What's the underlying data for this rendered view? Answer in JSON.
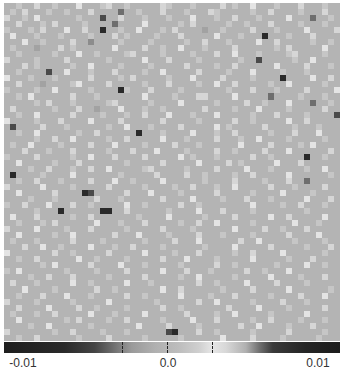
{
  "chart_data": {
    "type": "heatmap",
    "title": "",
    "xlabel": "",
    "ylabel": "",
    "grid_size": [
      56,
      56
    ],
    "colormap": "diverging gray (dark at both extremes, light near +0.003)",
    "value_range": [
      -0.012,
      0.012
    ],
    "base_color": "#b4b4b4",
    "colorbar": {
      "orientation": "horizontal",
      "position": "bottom",
      "tick_labels": [
        "-0.01",
        "0.0",
        "0.01"
      ],
      "tick_label_positions_px": [
        23,
        168,
        318
      ],
      "dashed_ticks_px": [
        122,
        167,
        212
      ]
    },
    "levels_legend": {
      "0": "#b4b4b4",
      "1": "#c6c6c6",
      "2": "#d6d6d6",
      "3": "#e4e4e4",
      "4": "#a2a2a2",
      "5": "#8c8c8c",
      "6": "#6e6e6e",
      "7": "#4a4a4a",
      "8": "#2a2a2a"
    },
    "rows": [
      "00100200100030001200100000210001000020100300010002000100",
      "01020001001000200006001000200010002100000100200001000200",
      "20010300000010007002000100010003000100200010000300060010",
      "00200010200001000060000300000102000001001000200001000100",
      "10001020003002008001003000102000040010000200010000300002",
      "03000100010000100020100001000200000300010008000100020000",
      "00030010000200500001000010000010020001000030020000010010",
      "01000400020100000030000200100300010000200000010200000300",
      "00100000100030010000120000100001000200300010000120000100",
      "20000100002000000100000300020000100000010070000010030000",
      "00020100000100300001000010000020000100200000030000200010",
      "00100007003000100020000100300000200001000300001000100000",
      "30001000100000200001020000010003000020000100008000030020",
      "00200040000130000200000100020000100300200000100300000100",
      "10000100300000100008100020000100000001000200010000200003",
      "00103000000200010000000300001000220000300000600001000100",
      "00000102000100000120000010000300000100002001000300060010",
      "02000000100020040003000100100000020000100030000100000200",
      "00100300000200001000100200030001000300000100020000100007",
      "30000100020000300002000000200000100000200100000300200000",
      "07000020001000000100300010000200000301000002000010001000",
      "00100300000010020000008000100003000100200000100020003000",
      "00000100200300000100200000300010000200010030000100000100",
      "01003000010000200030000100002000100000030000200001030000",
      "00020001000200000100020003000010000200100002000300000020",
      "10000200000100300020000200000301000100000200100000800100",
      "00300000100020000000100000200000300002010000030002000000",
      "00001002000100200300000120000010000200003000100000100300",
      "08000010000300000001000002000020010000100200000300000010",
      "00100200010000200030010000300000010000200001000200600000",
      "20000030000100000200000100001002000100300000200010000200",
      "00300000200008700000200030000100000200000100003000010000",
      "00001000100000020001000000200003000010002000100000300020",
      "10020003000200100000300100000200100000000300001002000100",
      "00000100080000008800200000010000300020000100000000100000",
      "03000200000100200000001000030000010000200000300200000300",
      "00100010200000030001000200000100200300000100000030001000",
      "20000300001000200000100000200001000000300002001000200000",
      "00300000100300000020003000010000200010000100000200003000",
      "01000100000200001000000100002000300000020030000010000100",
      "00020030010000300010020000100000010000300000200000100020",
      "30000000200100000200000300001000200000100200003000000100",
      "00100200000030010000100000200030000100000300000100020000",
      "00000010300000200003000100000100000200100000010000300100",
      "10300000001000010000200000300020001000002001000300000000",
      "00001002000200000100000200000100300000100000300001000200",
      "02000100000300100000300010000000200100003000020000100000",
      "00030000100000020010000000300200000010000200000300000010",
      "00100020003000100000200100000300001000200000100002000300",
      "20000100000100000300000001000000200300000100002000100000",
      "00200003000020010000100000200100000002000030000100000200",
      "01000100200000300010000300000020000100300000100000300000",
      "00300000001020000100200000100003000200000100200001000100",
      "00001003000000100000003000020000100000020030000100020000",
      "20000000100200001000100000078000200100000100000200000100",
      "00100200000010000200000100000100000030000200001000001000"
    ]
  }
}
